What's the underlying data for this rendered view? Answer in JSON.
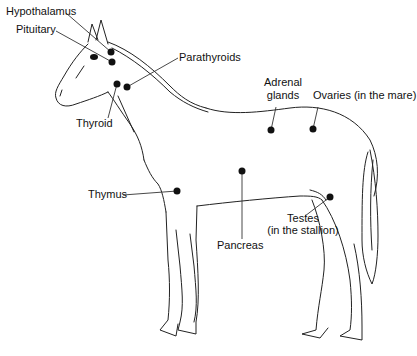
{
  "diagram": {
    "glands": [
      {
        "id": "hypothalamus",
        "label": "Hypothalamus",
        "dot": [
          111,
          52
        ]
      },
      {
        "id": "pituitary",
        "label": "Pituitary",
        "dot": [
          112,
          62
        ]
      },
      {
        "id": "parathyroids",
        "label": "Parathyroids",
        "dot": [
          127,
          87
        ]
      },
      {
        "id": "thyroid",
        "label": "Thyroid",
        "dot": [
          117,
          84
        ]
      },
      {
        "id": "adrenal-glands",
        "label_line1": "Adrenal",
        "label_line2": "glands",
        "dot": [
          271,
          130
        ]
      },
      {
        "id": "ovaries",
        "label": "Ovaries (in the mare)",
        "dot": [
          313,
          129
        ]
      },
      {
        "id": "thymus",
        "label": "Thymus",
        "dot": [
          177,
          191
        ]
      },
      {
        "id": "pancreas",
        "label": "Pancreas",
        "dot": [
          242,
          171
        ]
      },
      {
        "id": "testes",
        "label_line1": "Testes",
        "label_line2": "(in the stallion)",
        "dot": [
          330,
          197
        ]
      }
    ],
    "colors": {
      "ink": "#111111",
      "background": "#ffffff"
    }
  }
}
